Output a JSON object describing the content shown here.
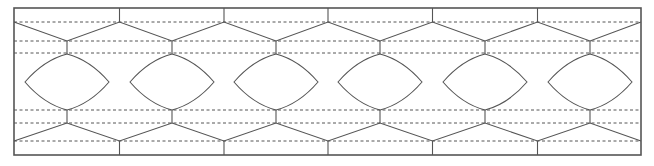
{
  "diagram": {
    "type": "eye-pattern-hexagon-grid",
    "stroke_color": "#555555",
    "dash_color": "#555555",
    "frame": {
      "x1": 14,
      "y1": 8,
      "x2": 641,
      "y2": 155
    },
    "dashed_lines_y": [
      22,
      41,
      53,
      110,
      123,
      141
    ],
    "eye_centers_x": [
      67,
      172,
      276,
      380,
      485,
      590
    ],
    "eye": {
      "top_y": 54,
      "bottom_y": 110,
      "half_width": 42
    },
    "upper_outer_y": 22,
    "upper_inner_y": 41,
    "lower_inner_y": 123,
    "lower_outer_y": 141,
    "eye_count": 6
  }
}
